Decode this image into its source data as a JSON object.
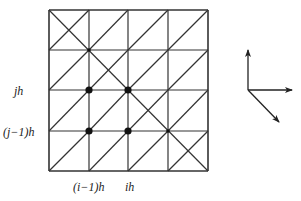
{
  "diagram": {
    "type": "triangulated-grid",
    "grid": {
      "cols": 4,
      "rows": 4,
      "x_lines": [
        49,
        89,
        128,
        168,
        208
      ],
      "y_lines": [
        10,
        50,
        90,
        131,
        171
      ],
      "cell_diagonal": "bottom-left-to-top-right",
      "main_anti_diagonal": {
        "from": [
          49,
          10
        ],
        "to": [
          208,
          171
        ]
      },
      "line_color": "#333333"
    },
    "nodes": [
      {
        "x": 89,
        "y": 90,
        "label": "((i-1)h, jh)",
        "size": "large"
      },
      {
        "x": 128,
        "y": 90,
        "label": "(ih, jh)",
        "size": "large"
      },
      {
        "x": 89,
        "y": 131,
        "label": "((i-1)h, (j-1)h)",
        "size": "large"
      },
      {
        "x": 128,
        "y": 131,
        "label": "(ih, (j-1)h)",
        "size": "large"
      },
      {
        "x": 89,
        "y": 50,
        "size": "small"
      },
      {
        "x": 168,
        "y": 131,
        "size": "small"
      }
    ],
    "y_labels": [
      {
        "text": "jh",
        "y": 90
      },
      {
        "text": "(j−1)h",
        "y": 131
      }
    ],
    "x_labels": [
      {
        "text": "(i−1)h",
        "x": 89
      },
      {
        "text": "ih",
        "x": 128
      }
    ],
    "direction_vectors": {
      "origin": [
        248,
        90
      ],
      "arrows": [
        {
          "name": "up",
          "to": [
            248,
            50
          ]
        },
        {
          "name": "right",
          "to": [
            292,
            90
          ]
        },
        {
          "name": "down-right",
          "to": [
            279,
            122
          ]
        }
      ]
    }
  }
}
